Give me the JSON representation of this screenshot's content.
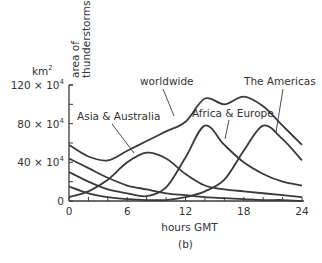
{
  "chart_data": {
    "type": "line",
    "title": "",
    "caption": "(b)",
    "xlabel": "hours GMT",
    "ylabel": "area of thunderstorms",
    "yunit": "km²",
    "xlim": [
      0,
      24
    ],
    "ylim": [
      0,
      120
    ],
    "x_ticks": [
      0,
      6,
      12,
      18,
      24
    ],
    "x_tick_labels": [
      "0",
      "6",
      "12",
      "18",
      "24"
    ],
    "y_ticks": [
      0,
      40,
      80,
      120
    ],
    "y_tick_labels": [
      "0",
      "40 × 10⁴",
      "80 × 10⁴",
      "120 × 10⁴"
    ],
    "grid": false,
    "legend": "inline labels",
    "x": [
      0,
      2,
      4,
      6,
      8,
      10,
      12,
      14,
      16,
      18,
      20,
      22,
      24
    ],
    "series": [
      {
        "name": "worldwide",
        "values": [
          58,
          46,
          42,
          52,
          62,
          72,
          82,
          106,
          100,
          108,
          98,
          78,
          58
        ]
      },
      {
        "name": "Asia & Australia",
        "values": [
          4,
          10,
          22,
          40,
          50,
          44,
          28,
          16,
          12,
          10,
          8,
          6,
          4
        ]
      },
      {
        "name": "Africa & Europe",
        "values": [
          30,
          20,
          12,
          8,
          5,
          14,
          45,
          78,
          58,
          40,
          28,
          20,
          16
        ]
      },
      {
        "name": "The Americas",
        "values": [
          15,
          8,
          4,
          2,
          1,
          1,
          4,
          10,
          22,
          52,
          78,
          64,
          42
        ]
      },
      {
        "name": "residual decay",
        "values": [
          44,
          34,
          24,
          16,
          12,
          8,
          6,
          4,
          3,
          2,
          1,
          1,
          0
        ]
      }
    ]
  },
  "labels": {
    "worldwide": "worldwide",
    "asia": "Asia & Australia",
    "africa": "Africa & Europe",
    "americas": "The Americas"
  }
}
